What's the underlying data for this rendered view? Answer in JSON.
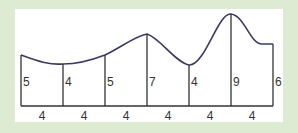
{
  "diagram": {
    "strip_width_labels": [
      "4",
      "4",
      "4",
      "4",
      "4",
      "4"
    ],
    "height_labels": [
      "5",
      "4",
      "5",
      "7",
      "4",
      "9",
      "6"
    ],
    "colors": {
      "background": "#dcebd2",
      "panel": "#ffffff",
      "curve": "#3a3a66",
      "lines": "#333333"
    }
  }
}
